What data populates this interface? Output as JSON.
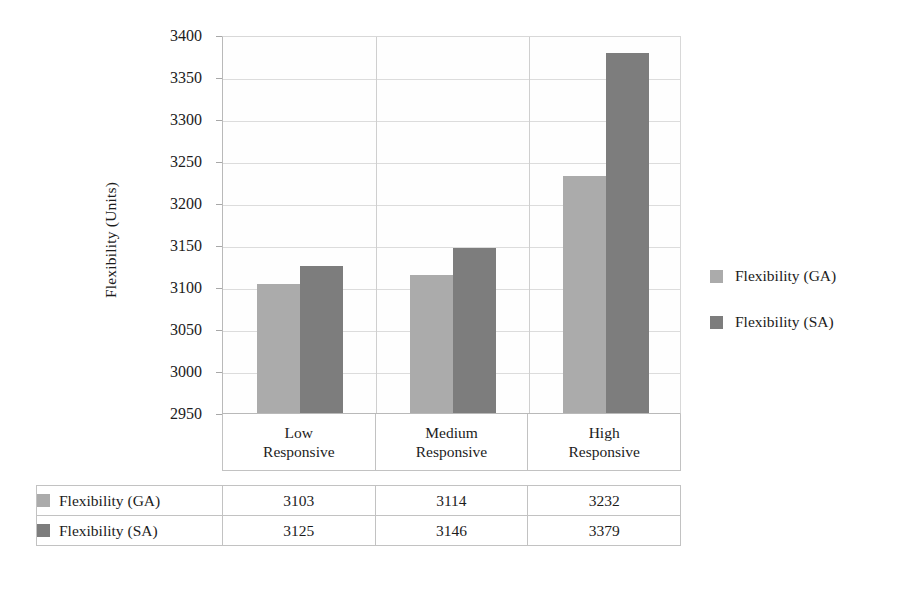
{
  "chart_data": {
    "type": "bar",
    "title": "",
    "xlabel": "",
    "ylabel": "Flexibility (Units)",
    "categories": [
      "Low Responsive",
      "Medium Responsive",
      "High Responsive"
    ],
    "category_lines": [
      [
        "Low",
        "Responsive"
      ],
      [
        "Medium",
        "Responsive"
      ],
      [
        "High",
        "Responsive"
      ]
    ],
    "series": [
      {
        "name": "Flexibility (GA)",
        "color": "#ababab",
        "values": [
          3103,
          3114,
          3232
        ]
      },
      {
        "name": "Flexibility (SA)",
        "color": "#7d7d7d",
        "values": [
          3125,
          3146,
          3379
        ]
      }
    ],
    "ylim": [
      2950,
      3400
    ],
    "ytick_step": 50,
    "yticks": [
      2950,
      3000,
      3050,
      3100,
      3150,
      3200,
      3250,
      3300,
      3350,
      3400
    ],
    "ytick_labels": [
      "2950",
      "3000",
      "3050",
      "3100",
      "3150",
      "3200",
      "3250",
      "3300",
      "3350",
      "3400"
    ],
    "grid": true,
    "legend_position": "right",
    "legend": [
      "Flexibility (GA)",
      "Flexibility (SA)"
    ],
    "data_table": {
      "visible": true,
      "row_headers": [
        "Flexibility (GA)",
        "Flexibility (SA)"
      ],
      "column_headers": [
        "Low Responsive",
        "Medium Responsive",
        "High Responsive"
      ],
      "rows": [
        {
          "label": "Flexibility (GA)",
          "swatch": "#ababab",
          "values": [
            "3103",
            "3114",
            "3232"
          ]
        },
        {
          "label": "Flexibility (SA)",
          "swatch": "#7d7d7d",
          "values": [
            "3125",
            "3146",
            "3379"
          ]
        }
      ]
    }
  },
  "axis": {
    "y_title": "Flexibility (Units)"
  }
}
